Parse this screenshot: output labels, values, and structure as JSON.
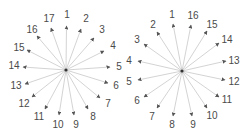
{
  "diagrams": [
    {
      "name": "left-star",
      "center": [
        66,
        70
      ],
      "rays": [
        {
          "label": "1",
          "lx": 67,
          "ly": 18,
          "tx": 66.5,
          "ty": 26
        },
        {
          "label": "2",
          "lx": 86,
          "ly": 22,
          "tx": 81,
          "ty": 29
        },
        {
          "label": "3",
          "lx": 102,
          "ly": 33,
          "tx": 94,
          "ty": 38
        },
        {
          "label": "4",
          "lx": 113,
          "ly": 49,
          "tx": 104,
          "ty": 51
        },
        {
          "label": "5",
          "lx": 119,
          "ly": 70,
          "tx": 110,
          "ty": 67
        },
        {
          "label": "6",
          "lx": 116,
          "ly": 89,
          "tx": 108,
          "ty": 83
        },
        {
          "label": "7",
          "lx": 108,
          "ly": 107,
          "tx": 100,
          "ty": 98
        },
        {
          "label": "8",
          "lx": 93,
          "ly": 120,
          "tx": 88,
          "ty": 109
        },
        {
          "label": "9",
          "lx": 76,
          "ly": 128,
          "tx": 74,
          "ty": 115
        },
        {
          "label": "10",
          "lx": 58,
          "ly": 128,
          "tx": 59,
          "ty": 115
        },
        {
          "label": "11",
          "lx": 39,
          "ly": 120,
          "tx": 45,
          "ty": 109
        },
        {
          "label": "12",
          "lx": 24,
          "ly": 107,
          "tx": 32,
          "ty": 97
        },
        {
          "label": "13",
          "lx": 16,
          "ly": 89,
          "tx": 25,
          "ty": 84
        },
        {
          "label": "14",
          "lx": 14,
          "ly": 69,
          "tx": 23,
          "ty": 67
        },
        {
          "label": "15",
          "lx": 19,
          "ly": 51,
          "tx": 27,
          "ty": 50
        },
        {
          "label": "16",
          "lx": 32,
          "ly": 33,
          "tx": 37,
          "ty": 36
        },
        {
          "label": "17",
          "lx": 49,
          "ly": 22,
          "tx": 51,
          "ty": 28
        }
      ]
    },
    {
      "name": "right-star",
      "center": [
        182,
        71
      ],
      "rays": [
        {
          "label": "1",
          "lx": 172,
          "ly": 18,
          "tx": 173,
          "ty": 24
        },
        {
          "label": "16",
          "lx": 193,
          "ly": 19,
          "tx": 191,
          "ty": 25
        },
        {
          "label": "15",
          "lx": 212,
          "ly": 28,
          "tx": 207,
          "ty": 31
        },
        {
          "label": "14",
          "lx": 227,
          "ly": 43,
          "tx": 219,
          "ty": 43
        },
        {
          "label": "13",
          "lx": 234,
          "ly": 64,
          "tx": 226,
          "ty": 61
        },
        {
          "label": "12",
          "lx": 234,
          "ly": 85,
          "tx": 225,
          "ty": 80
        },
        {
          "label": "11",
          "lx": 227,
          "ly": 103,
          "tx": 219,
          "ty": 97
        },
        {
          "label": "10",
          "lx": 212,
          "ly": 119,
          "tx": 207,
          "ty": 108
        },
        {
          "label": "9",
          "lx": 193,
          "ly": 128,
          "tx": 192,
          "ty": 116
        },
        {
          "label": "8",
          "lx": 172,
          "ly": 128,
          "tx": 173,
          "ty": 116
        },
        {
          "label": "7",
          "lx": 152,
          "ly": 120,
          "tx": 157,
          "ty": 108
        },
        {
          "label": "6",
          "lx": 137,
          "ly": 104,
          "tx": 144,
          "ty": 97
        },
        {
          "label": "5",
          "lx": 129,
          "ly": 85,
          "tx": 138,
          "ty": 80
        },
        {
          "label": "4",
          "lx": 129,
          "ly": 64,
          "tx": 138,
          "ty": 61
        },
        {
          "label": "3",
          "lx": 137,
          "ly": 43,
          "tx": 144,
          "ty": 44
        },
        {
          "label": "2",
          "lx": 153,
          "ly": 28,
          "tx": 157,
          "ty": 32
        }
      ]
    }
  ],
  "colors": {
    "ray": "#c8c8c8",
    "arrow": "#555555",
    "label": "#4a4a4a",
    "hub": "#333333"
  }
}
